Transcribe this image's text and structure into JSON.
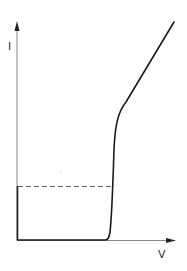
{
  "diagram": {
    "type": "current-voltage characteristic",
    "axes": {
      "y_label": "I",
      "x_label": "V"
    },
    "colors": {
      "axis": "#7a7a7a",
      "curve": "#1a1a1a",
      "dashed": "#666666",
      "background": "#ffffff"
    },
    "elements": [
      "vertical axis with arrow labeled I",
      "horizontal axis with arrow labeled V",
      "solid curve: flat near zero current, sharp rise at threshold voltage, then linear increase",
      "dashed horizontal reference line at low current level",
      "solid vertical segment on I axis from origin to dashed line"
    ]
  }
}
